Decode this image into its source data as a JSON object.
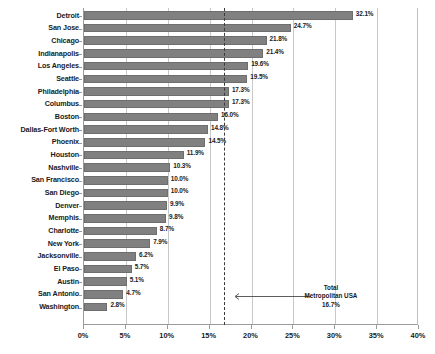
{
  "chart_data": {
    "type": "bar",
    "orientation": "horizontal",
    "title": "",
    "subtitle": "",
    "xlabel": "",
    "ylabel": "",
    "xlim": [
      0,
      40
    ],
    "xtick_labels": [
      "0%",
      "5%",
      "10%",
      "15%",
      "20%",
      "25%",
      "30%",
      "35%",
      "40%"
    ],
    "xtick_values": [
      0,
      5,
      10,
      15,
      20,
      25,
      30,
      35,
      40
    ],
    "grid": true,
    "legend": false,
    "bar_color": "#808080",
    "categories": [
      "Detroit",
      "San Jose",
      "Chicago",
      "Indianapolis",
      "Los Angeles",
      "Seattle",
      "Philadelphia",
      "Columbus",
      "Boston",
      "Dallas-Fort Worth",
      "Phoenix",
      "Houston",
      "Nashville",
      "San Francisco",
      "San Diego",
      "Denver",
      "Memphis",
      "Charlotte",
      "New York",
      "Jacksonville",
      "El Paso",
      "Austin",
      "San Antonio",
      "Washington"
    ],
    "values": [
      32.1,
      24.7,
      21.8,
      21.4,
      19.6,
      19.5,
      17.3,
      17.3,
      16.0,
      14.8,
      14.5,
      11.9,
      10.3,
      10.0,
      10.0,
      9.9,
      9.8,
      8.7,
      7.9,
      6.2,
      5.7,
      5.1,
      4.7,
      2.8
    ],
    "value_labels": [
      "32.1%",
      "24.7%",
      "21.8%",
      "21.4%",
      "19.6%",
      "19.5%",
      "17.3%",
      "17.3%",
      "16.0%",
      "14.8%",
      "14.5%",
      "11.9%",
      "10.3%",
      "10.0%",
      "10.0%",
      "9.9%",
      "9.8%",
      "8.7%",
      "7.9%",
      "6.2%",
      "5.7%",
      "5.1%",
      "4.7%",
      "2.8%"
    ],
    "reference_line": {
      "value": 16.7,
      "style": "dashed",
      "color": "#3a3a3a",
      "label_line1": "Total",
      "label_line2": "Metropolitan USA",
      "label_line3": "16.7%"
    }
  }
}
